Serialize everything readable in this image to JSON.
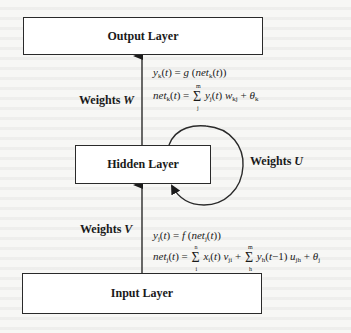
{
  "diagram": {
    "layers": {
      "output": "Output Layer",
      "hidden": "Hidden Layer",
      "input": "Input Layer"
    },
    "weights": {
      "w_prefix": "Weights",
      "w_symbol": "W",
      "u_prefix": "Weights",
      "u_symbol": "U",
      "v_prefix": "Weights",
      "v_symbol": "V"
    },
    "equations": {
      "output_activation": "y_k(t) = g(net_k(t))",
      "output_net": "net_k(t) = Σ_j^m y_j(t) w_kj + θ_k",
      "hidden_activation": "y_j(t) = f(net_j(t))",
      "hidden_net": "net_j(t) = Σ_i^n x_i(t) v_ji + Σ_h^m y_h(t−1) u_jh + θ_j"
    },
    "colors": {
      "stroke": "#2a2a2a",
      "background": "#f7f7f5"
    }
  }
}
